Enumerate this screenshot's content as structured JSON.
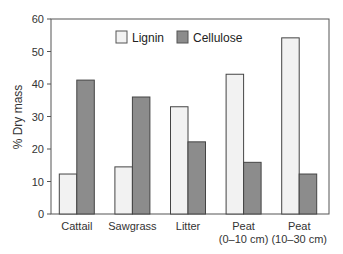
{
  "chart_data": {
    "type": "bar",
    "title": "",
    "xlabel": "",
    "ylabel": "% Dry mass",
    "ylim": [
      0,
      60
    ],
    "yticks": [
      0,
      10,
      20,
      30,
      40,
      50,
      60
    ],
    "grid": false,
    "legend_position": "top-center",
    "categories": [
      [
        "Cattail"
      ],
      [
        "Sawgrass"
      ],
      [
        "Litter"
      ],
      [
        "Peat",
        "(0–10 cm)"
      ],
      [
        "Peat",
        "(10–30 cm)"
      ]
    ],
    "series": [
      {
        "name": "Lignin",
        "color": "#f2f2f2",
        "values": [
          12.3,
          14.5,
          33,
          43,
          54.2
        ]
      },
      {
        "name": "Cellulose",
        "color": "#8c8c8c",
        "values": [
          41.2,
          36,
          22.2,
          15.9,
          12.3
        ]
      }
    ]
  }
}
